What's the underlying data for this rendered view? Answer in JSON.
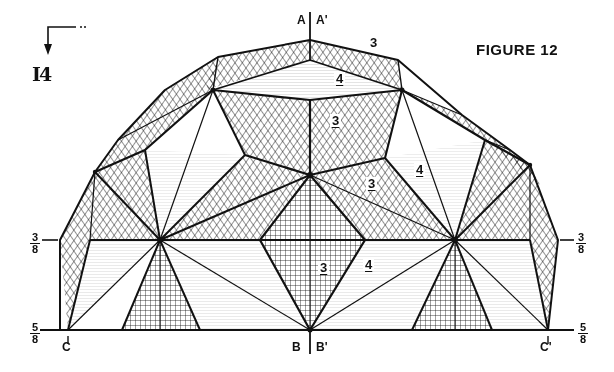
{
  "figure": {
    "title": "FIGURE 12",
    "section_marker": {
      "id": "I-4",
      "display": "I4",
      "arrow_icon": "section-arrow-down"
    },
    "reference_marks": {
      "top_left": "A",
      "top_right": "A'",
      "bottom_center_left": "B",
      "bottom_center_right": "B'",
      "bottom_left": "C",
      "bottom_right": "C'"
    },
    "edge_fractions": {
      "left_upper": {
        "num": "3",
        "den": "8"
      },
      "right_upper": {
        "num": "3",
        "den": "8"
      },
      "left_lower": {
        "num": "5",
        "den": "8"
      },
      "right_lower": {
        "num": "5",
        "den": "8"
      }
    },
    "face_labels": [
      {
        "text": "3",
        "underlined": false,
        "position": "top-right-of-apex"
      },
      {
        "text": "4",
        "underlined": true,
        "position": "top-center"
      },
      {
        "text": "3",
        "underlined": true,
        "position": "upper-center"
      },
      {
        "text": "3",
        "underlined": true,
        "position": "center-right"
      },
      {
        "text": "4",
        "underlined": true,
        "position": "right-diamond"
      },
      {
        "text": "3",
        "underlined": true,
        "position": "lower-center"
      },
      {
        "text": "4",
        "underlined": true,
        "position": "lower-center-right"
      }
    ],
    "colors": {
      "ink": "#111111",
      "paper": "#ffffff",
      "light_hatch": "#9a9a9a"
    }
  }
}
